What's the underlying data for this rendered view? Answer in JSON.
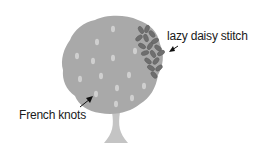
{
  "labels": {
    "lazy_daisy": "lazy daisy stitch",
    "french_knots": "French knots"
  },
  "colors": {
    "foliage": "#a9a9a9",
    "knots": "#cfcfcf",
    "daisy_petals": "#6e6e6e",
    "trunk": "#c4c4c4",
    "arrow": "#111111"
  }
}
